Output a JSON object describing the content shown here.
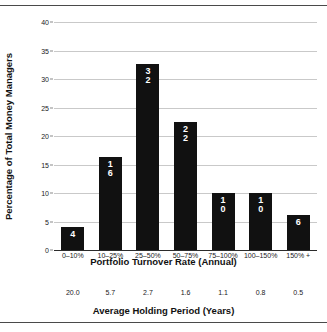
{
  "chart_data": {
    "type": "bar",
    "title": "",
    "xlabel": "Portfolio Turnover Rate (Annual)",
    "ylabel": "Percentage of Total Money Managers",
    "secondary_xlabel": "Average Holding Period (Years)",
    "categories": [
      "0–10%",
      "10–25%",
      "25–50%",
      "50–75%",
      "75–100%",
      "100–150%",
      "150% +"
    ],
    "values": [
      4,
      16,
      32,
      22,
      10,
      10,
      6
    ],
    "bar_heights_percent": [
      4.0,
      16.4,
      32.7,
      22.5,
      10.0,
      10.0,
      6.2
    ],
    "data_labels": [
      "4",
      "16",
      "32",
      "22",
      "10",
      "10",
      "6"
    ],
    "secondary_axis_values": [
      "20.0",
      "5.7",
      "2.7",
      "1.6",
      "1.1",
      "0.8",
      "0.5"
    ],
    "yticks": [
      0,
      5,
      10,
      15,
      20,
      25,
      30,
      35,
      40
    ],
    "ytick_labels": [
      "0",
      "5",
      "10",
      "15",
      "20",
      "25",
      "30",
      "35",
      "40"
    ],
    "ylim": [
      0,
      40
    ],
    "grid": true,
    "legend": false,
    "bar_color": "#111111",
    "label_color": "#ffffff",
    "grid_color": "#c9c9c9",
    "axis_color": "#2b2b2b"
  }
}
